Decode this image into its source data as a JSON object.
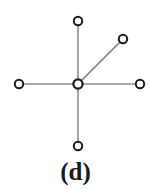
{
  "figure": {
    "caption": "(d)",
    "background_color": "#ffffff",
    "width": 151,
    "height": 189
  },
  "chart_data": {
    "type": "diagram",
    "diagram_type": "node-link-graph",
    "title": "(d)",
    "node_style": {
      "shape": "circle",
      "fill": "#ffffff",
      "stroke": "#1a1a1a",
      "radius": 4.2,
      "stroke_width": 2.0,
      "center_radius": 4.6,
      "center_stroke_width": 2.2
    },
    "edge_style": {
      "stroke": "#8c8c8c",
      "stroke_width": 1.6,
      "diagonal_stroke": "#7a7a7a"
    },
    "nodes": [
      {
        "id": "center",
        "label": "",
        "role": "hub",
        "x": 78,
        "y": 84
      },
      {
        "id": "n_top",
        "label": "",
        "role": "leaf",
        "x": 78,
        "y": 21
      },
      {
        "id": "n_upper_right",
        "label": "",
        "role": "leaf",
        "x": 123,
        "y": 39
      },
      {
        "id": "n_left",
        "label": "",
        "role": "leaf",
        "x": 19,
        "y": 84
      },
      {
        "id": "n_right",
        "label": "",
        "role": "leaf",
        "x": 140,
        "y": 84
      },
      {
        "id": "n_bottom",
        "label": "",
        "role": "leaf",
        "x": 78,
        "y": 146
      }
    ],
    "edges": [
      {
        "id": "e_top",
        "source": "center",
        "target": "n_top",
        "x1": 78,
        "y1": 84,
        "x2": 78,
        "y2": 21
      },
      {
        "id": "e_upper_right",
        "source": "center",
        "target": "n_upper_right",
        "x1": 78,
        "y1": 84,
        "x2": 123,
        "y2": 39
      },
      {
        "id": "e_left",
        "source": "center",
        "target": "n_left",
        "x1": 78,
        "y1": 84,
        "x2": 19,
        "y2": 84
      },
      {
        "id": "e_right",
        "source": "center",
        "target": "n_right",
        "x1": 78,
        "y1": 84,
        "x2": 140,
        "y2": 84
      },
      {
        "id": "e_bottom",
        "source": "center",
        "target": "n_bottom",
        "x1": 78,
        "y1": 84,
        "x2": 78,
        "y2": 146
      }
    ],
    "node_count": 6,
    "edge_count": 5,
    "legend": [],
    "axis_labels": {
      "xlabel": "",
      "ylabel": ""
    },
    "grid": false
  }
}
